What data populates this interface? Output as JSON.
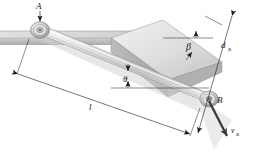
{
  "figure": {
    "kind": "engineering-mechanics-diagram",
    "background_color": "#ffffff",
    "line_color": "#1a1a1a",
    "surface_fill_light": "#e8e8e8",
    "surface_fill_mid": "#d2d2d2",
    "surface_fill_dark": "#b6b6b6",
    "bar_fill": "#dcdcdc",
    "shadow_color": "#cfcfcf"
  },
  "labels": {
    "point_a": "A",
    "point_b": "B",
    "length": "l",
    "angle_theta": "θ",
    "angle_beta": "β",
    "distance_b": "d",
    "distance_b_sub": "B",
    "velocity_b": "v",
    "velocity_b_sub": "B"
  },
  "annotations": {
    "leader_a": "arrow from label A down to pin joint at A",
    "leader_b": "leader line from label B to pin joint at B",
    "dim_length": "dimension line with arrowheads both ends spanning A to B labelled l",
    "dim_distance_b": "dimension line with arrowheads both ends on the incline labelled d_B",
    "angle_theta_marker": "theta measured between bar AB and horizontal reference line",
    "angle_beta_marker": "beta measured between incline top edge and horizontal reference line",
    "velocity_vector": "bold arrow from B directed down the incline labelled v_B"
  },
  "geometry": {
    "point_a_px": [
      40,
      30
    ],
    "point_b_px": [
      209,
      100
    ],
    "theta_vertex_px": [
      128,
      72
    ],
    "beta_vertex_px": [
      163,
      38
    ],
    "incline_apex_px": [
      163,
      38
    ]
  }
}
